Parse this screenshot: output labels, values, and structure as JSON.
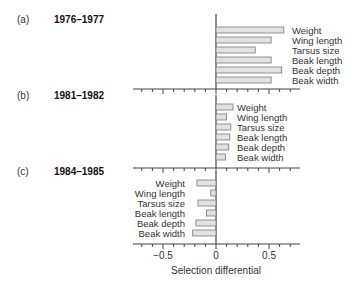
{
  "chart_data": [
    {
      "type": "bar",
      "orientation": "horizontal",
      "panel": "(a)",
      "title": "1976–1977",
      "categories": [
        "Weight",
        "Wing length",
        "Tarsus size",
        "Beak length",
        "Beak depth",
        "Beak width"
      ],
      "values": [
        0.64,
        0.52,
        0.37,
        0.52,
        0.62,
        0.52
      ],
      "xlabel": "",
      "ylabel": "",
      "xlim": [
        -0.75,
        0.8
      ]
    },
    {
      "type": "bar",
      "orientation": "horizontal",
      "panel": "(b)",
      "title": "1981–1982",
      "categories": [
        "Weight",
        "Wing length",
        "Tarsus size",
        "Beak length",
        "Beak depth",
        "Beak width"
      ],
      "values": [
        0.16,
        0.1,
        0.14,
        0.13,
        0.12,
        0.09
      ],
      "xlabel": "",
      "ylabel": "",
      "xlim": [
        -0.75,
        0.8
      ]
    },
    {
      "type": "bar",
      "orientation": "horizontal",
      "panel": "(c)",
      "title": "1984–1985",
      "categories": [
        "Weight",
        "Wing length",
        "Tarsus size",
        "Beak length",
        "Beak depth",
        "Beak width"
      ],
      "values": [
        -0.18,
        -0.05,
        -0.17,
        -0.09,
        -0.19,
        -0.22
      ],
      "xlabel": "Selection differential",
      "ylabel": "",
      "xlim": [
        -0.75,
        0.8
      ],
      "xticks": [
        -0.5,
        0,
        0.5
      ],
      "xtick_labels": [
        "−0.5",
        "0",
        "0.5"
      ]
    }
  ],
  "panels": [
    {
      "letter": "(a)",
      "years": "1976–1977"
    },
    {
      "letter": "(b)",
      "years": "1981–1982"
    },
    {
      "letter": "(c)",
      "years": "1984–1985"
    }
  ],
  "axis": {
    "title": "Selection differential",
    "tick_labels": [
      "−0.5",
      "0",
      "0.5"
    ]
  },
  "colors": {
    "bar_fill": "#e2e2e2",
    "bar_stroke": "#7a7a7a",
    "axis": "#444444"
  }
}
